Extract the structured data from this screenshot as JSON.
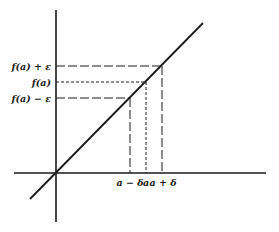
{
  "diagram": {
    "type": "epsilon-delta continuity illustration",
    "colors": {
      "background": "#ffffff",
      "ink": "#1a1a1a"
    },
    "axes": {
      "origin": [
        56,
        173
      ],
      "x_axis": {
        "x1": 14,
        "x2": 266,
        "y": 173
      },
      "y_axis": {
        "x": 56,
        "y1": 10,
        "y2": 222
      }
    },
    "curve": {
      "name": "f(x) line",
      "x1": 30,
      "y1": 199,
      "x2": 203,
      "y2": 23
    },
    "y_labels": [
      {
        "id": "fa_plus_eps",
        "text": "f(a) + ε",
        "y": 66,
        "x_end": 161,
        "dash": "long"
      },
      {
        "id": "fa",
        "text": "f(a)",
        "y": 82,
        "x_end": 146,
        "dash": "short"
      },
      {
        "id": "fa_minus_eps",
        "text": "f(a) − ε",
        "y": 98,
        "x_end": 130,
        "dash": "long"
      }
    ],
    "x_labels": [
      {
        "id": "a_minus_delta",
        "text": "a − δ",
        "x": 130,
        "y_start": 98,
        "dash": "long"
      },
      {
        "id": "a",
        "text": "a",
        "x": 146,
        "y_start": 82,
        "dash": "short"
      },
      {
        "id": "a_plus_delta",
        "text": "a + δ",
        "x": 162,
        "y_start": 66,
        "dash": "long"
      }
    ]
  }
}
